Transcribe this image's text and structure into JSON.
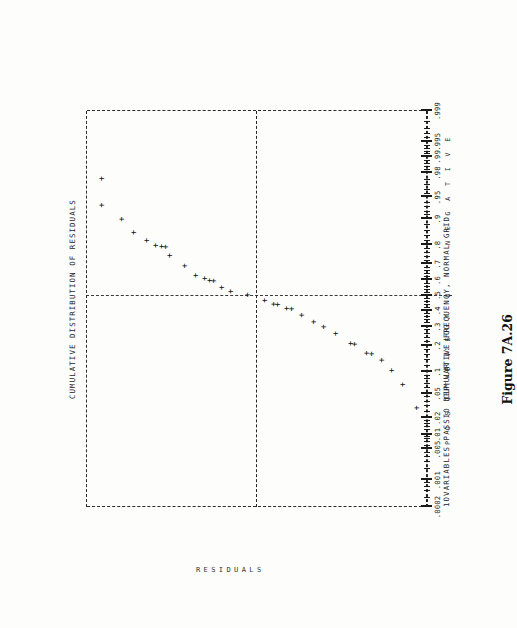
{
  "figure": {
    "caption": "Figure 7A.26",
    "header_label": "1OVARIABLES PASSIO  DEP VAR 1: LOG Y",
    "top_axis_title": "CUMULATIVE DISTRIBUTION OF RESIDUALS",
    "bottom_axis_title": "CUMULATIVE FREQUENCY, NORMAL GRID",
    "side_label": "RESIDUALS",
    "sign_labels": {
      "positive": "P O S I T I V E",
      "zero": "0",
      "negative": "N E G A T I V E"
    }
  },
  "chart_data": {
    "type": "scatter",
    "title": "CUMULATIVE DISTRIBUTION OF RESIDUALS",
    "xlabel": "CUMULATIVE FREQUENCY, NORMAL GRID",
    "ylabel": "RESIDUALS",
    "grid": "normal-probability",
    "legend": "none",
    "annotations": [
      "1OVARIABLES PASSIO  DEP VAR 1: LOG Y",
      "P O S I T I V E",
      "0",
      "N E G A T I V E"
    ],
    "x_axis": {
      "name": "cumulative frequency (normal probability scale)",
      "tick_labels": [
        ".0002",
        ".001",
        ".005",
        ".01",
        ".02",
        ".05",
        ".1",
        ".2",
        ".3",
        ".4",
        ".5",
        ".6",
        ".7",
        ".8",
        ".9",
        ".95",
        ".98",
        ".99",
        ".995",
        ".999"
      ],
      "tick_values": [
        0.0002,
        0.001,
        0.005,
        0.01,
        0.02,
        0.05,
        0.1,
        0.2,
        0.3,
        0.4,
        0.5,
        0.6,
        0.7,
        0.8,
        0.9,
        0.95,
        0.98,
        0.99,
        0.995,
        0.999
      ],
      "range": [
        0.0002,
        0.999
      ]
    },
    "y_axis": {
      "name": "residual (signed, POSITIVE above 0, NEGATIVE below)",
      "labels": [
        "POSITIVE",
        "0",
        "NEGATIVE"
      ],
      "reference_lines": [
        {
          "name": "zero-residual",
          "style": "dashed"
        },
        {
          "name": "median-0.5",
          "style": "dashed"
        }
      ]
    },
    "points": [
      {
        "p": 0.975,
        "resid": 0.905
      },
      {
        "p": 0.935,
        "resid": 0.905
      },
      {
        "p": 0.9,
        "resid": 0.79
      },
      {
        "p": 0.855,
        "resid": 0.72
      },
      {
        "p": 0.822,
        "resid": 0.64
      },
      {
        "p": 0.8,
        "resid": 0.59
      },
      {
        "p": 0.795,
        "resid": 0.555
      },
      {
        "p": 0.793,
        "resid": 0.53
      },
      {
        "p": 0.748,
        "resid": 0.505
      },
      {
        "p": 0.69,
        "resid": 0.42
      },
      {
        "p": 0.632,
        "resid": 0.355
      },
      {
        "p": 0.614,
        "resid": 0.3
      },
      {
        "p": 0.6,
        "resid": 0.272
      },
      {
        "p": 0.598,
        "resid": 0.245
      },
      {
        "p": 0.553,
        "resid": 0.2
      },
      {
        "p": 0.528,
        "resid": 0.15
      },
      {
        "p": 0.505,
        "resid": 0.05
      },
      {
        "p": 0.468,
        "resid": -0.055
      },
      {
        "p": 0.443,
        "resid": -0.105
      },
      {
        "p": 0.44,
        "resid": -0.13
      },
      {
        "p": 0.415,
        "resid": -0.185
      },
      {
        "p": 0.412,
        "resid": -0.21
      },
      {
        "p": 0.372,
        "resid": -0.27
      },
      {
        "p": 0.33,
        "resid": -0.34
      },
      {
        "p": 0.3,
        "resid": -0.4
      },
      {
        "p": 0.262,
        "resid": -0.47
      },
      {
        "p": 0.212,
        "resid": -0.56
      },
      {
        "p": 0.208,
        "resid": -0.585
      },
      {
        "p": 0.168,
        "resid": -0.655
      },
      {
        "p": 0.165,
        "resid": -0.68
      },
      {
        "p": 0.14,
        "resid": -0.74
      },
      {
        "p": 0.105,
        "resid": -0.8
      },
      {
        "p": 0.068,
        "resid": -0.865
      },
      {
        "p": 0.03,
        "resid": -0.945
      }
    ]
  }
}
